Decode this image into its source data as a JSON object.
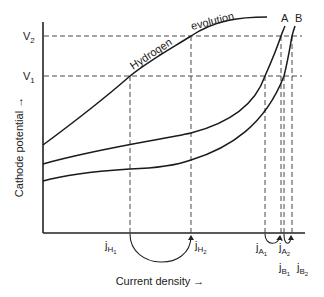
{
  "diagram": {
    "axes": {
      "y_label": "Cathode potential →",
      "x_label": "Current density →",
      "y_ticks": [
        {
          "label": "V",
          "sub": "2"
        },
        {
          "label": "V",
          "sub": "1"
        }
      ]
    },
    "curves": {
      "hydrogen": {
        "label_part1": "Hydrogen",
        "label_part2": "evolution"
      },
      "a": {
        "label": "A"
      },
      "b": {
        "label": "B"
      }
    },
    "x_markers": {
      "jH1": {
        "base": "j",
        "sub": "H",
        "subsub": "1"
      },
      "jH2": {
        "base": "j",
        "sub": "H",
        "subsub": "2"
      },
      "jA1": {
        "base": "j",
        "sub": "A",
        "subsub": "1"
      },
      "jA2": {
        "base": "j",
        "sub": "A",
        "subsub": "2"
      },
      "jB1": {
        "base": "j",
        "sub": "B",
        "subsub": "1"
      },
      "jB2": {
        "base": "j",
        "sub": "B",
        "subsub": "2"
      }
    },
    "colors": {
      "line": "#1a1a1a",
      "background": "#ffffff"
    }
  }
}
